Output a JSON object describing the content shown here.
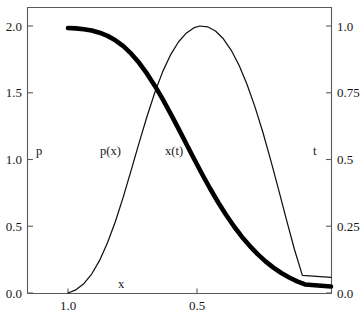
{
  "figure": {
    "background_color": "#ffffff",
    "frame_color": "#5a5a5a",
    "text_color": "#161616"
  },
  "axes": {
    "left": {
      "name": "p",
      "ticks": [
        "0.0",
        "0.5",
        "1.0",
        "1.5",
        "2.0"
      ]
    },
    "right": {
      "name": "t",
      "ticks": [
        "0.0",
        "0.25",
        "0.5",
        "0.75",
        "1.0"
      ]
    },
    "bottom": {
      "name": "x",
      "ticks": [
        "1.0",
        "0.5"
      ]
    }
  },
  "annotations": {
    "p_label": "p",
    "t_label": "t",
    "x_label": "x",
    "px_curve_label": "p(x)",
    "xt_curve_label": "x(t)"
  },
  "chart_data": {
    "type": "line",
    "title": "",
    "xlabel": "x",
    "ylabel": "p",
    "y2label": "t",
    "grid": false,
    "legend": "inline-annotations",
    "xlim": [
      1.22,
      0.09
    ],
    "x_axis_reversed": true,
    "xticks": [
      1.0,
      0.5
    ],
    "xticklabels": [
      "1.0",
      "0.5"
    ],
    "ylim": [
      0.0,
      2.0
    ],
    "yticks": [
      0.0,
      0.5,
      1.0,
      1.5,
      2.0
    ],
    "yticklabels": [
      "0.0",
      "0.5",
      "1.0",
      "1.5",
      "2.0"
    ],
    "y2lim": [
      0.0,
      1.0
    ],
    "y2ticks": [
      0.0,
      0.25,
      0.5,
      0.75,
      1.0
    ],
    "y2ticklabels": [
      "0.0",
      "0.25",
      "0.5",
      "0.75",
      "1.0"
    ],
    "series": [
      {
        "name": "p(x)",
        "label": "p(x)",
        "axis": "right",
        "style": "thin",
        "color": "#111111",
        "linewidth": 1.25,
        "description": "Rises from 0 at x=1.0, peaks at 1.0 near x=0.5, decays to 0 near x=0.16",
        "x": [
          1.0,
          0.97,
          0.94,
          0.91,
          0.88,
          0.85,
          0.82,
          0.79,
          0.76,
          0.73,
          0.7,
          0.67,
          0.64,
          0.61,
          0.58,
          0.55,
          0.52,
          0.5,
          0.47,
          0.44,
          0.41,
          0.38,
          0.35,
          0.32,
          0.29,
          0.26,
          0.23,
          0.2,
          0.17,
          0.14,
          0.11
        ],
        "y": [
          0.0,
          0.012,
          0.035,
          0.071,
          0.122,
          0.188,
          0.268,
          0.36,
          0.46,
          0.562,
          0.661,
          0.752,
          0.83,
          0.893,
          0.941,
          0.974,
          0.994,
          1.0,
          0.997,
          0.981,
          0.952,
          0.909,
          0.852,
          0.781,
          0.697,
          0.602,
          0.497,
          0.386,
          0.273,
          0.163,
          0.066
        ]
      },
      {
        "name": "x(t)",
        "label": "x(t)",
        "axis": "left",
        "style": "thick",
        "color": "#000000",
        "linewidth": 4.6,
        "description": "Sigmoidal decay from 2.0 at x=1.0 down to 0 near x=0.15",
        "x": [
          1.0,
          0.97,
          0.94,
          0.91,
          0.88,
          0.85,
          0.82,
          0.79,
          0.76,
          0.73,
          0.7,
          0.67,
          0.64,
          0.61,
          0.58,
          0.55,
          0.52,
          0.49,
          0.46,
          0.43,
          0.4,
          0.37,
          0.34,
          0.31,
          0.28,
          0.25,
          0.22,
          0.19,
          0.16,
          0.13,
          0.1
        ],
        "y": [
          1.985,
          1.982,
          1.976,
          1.966,
          1.95,
          1.926,
          1.893,
          1.849,
          1.793,
          1.724,
          1.643,
          1.551,
          1.45,
          1.342,
          1.229,
          1.114,
          1.0,
          0.888,
          0.781,
          0.68,
          0.586,
          0.5,
          0.422,
          0.353,
          0.291,
          0.237,
          0.19,
          0.15,
          0.116,
          0.087,
          0.064
        ]
      }
    ],
    "crossing_point": {
      "x": 0.66,
      "p_value": 1.5,
      "t_value": 0.75
    }
  }
}
